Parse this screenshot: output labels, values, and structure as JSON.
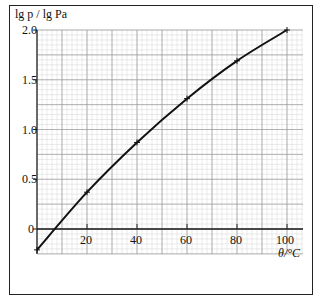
{
  "chart_data": {
    "type": "line",
    "title": "",
    "xlabel": "θ/°C",
    "ylabel": "lg p / lg Pa",
    "xlim": [
      0,
      106
    ],
    "ylim": [
      -0.25,
      2.0
    ],
    "x_ticks": [
      0,
      20,
      40,
      60,
      80,
      100
    ],
    "x_tick_labels": [
      "20",
      "40",
      "60",
      "80",
      "100"
    ],
    "y_ticks": [
      0,
      0.5,
      1.0,
      1.5,
      2.0
    ],
    "y_tick_labels": [
      "0",
      "0.5",
      "1.0",
      "1.5",
      "2.0"
    ],
    "grid": true,
    "marker": "cross",
    "series": [
      {
        "name": "lg p vs θ",
        "x": [
          0,
          20,
          40,
          60,
          80,
          100
        ],
        "values": [
          -0.21,
          0.37,
          0.87,
          1.31,
          1.69,
          2.0
        ]
      }
    ]
  },
  "labels": {
    "y_axis": "lg p / lg Pa",
    "x_axis": "θ/°C",
    "y_ticks": [
      "2.0",
      "1.5",
      "1.0",
      "0.5",
      "0"
    ],
    "x_ticks": [
      "20",
      "40",
      "60",
      "80",
      "100"
    ]
  },
  "colors": {
    "grid_major": "#9a9a9a",
    "grid_minor": "#d4d4d4",
    "curve": "#111111"
  }
}
